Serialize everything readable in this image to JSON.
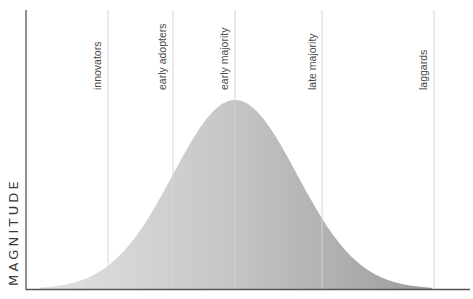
{
  "chart_data": {
    "type": "area",
    "title": "",
    "xlabel": "",
    "ylabel": "MAGNITUDE",
    "grid": false,
    "legend": null,
    "segments": [
      {
        "label": "innovators",
        "divider_x_px": 108
      },
      {
        "label": "early adopters",
        "divider_x_px": 173
      },
      {
        "label": "early majority",
        "divider_x_px": 235
      },
      {
        "label": "late majority",
        "divider_x_px": 322
      },
      {
        "label": "laggards",
        "divider_x_px": 434
      }
    ],
    "curve": {
      "shape": "normal distribution",
      "peak_x_px": 235,
      "peak_y_px": 100,
      "baseline_y_px": 289,
      "start_x_px": 40,
      "end_x_px": 432,
      "fill_gradient": [
        "#dcdcdc",
        "#c9c9c9",
        "#a4a4a4"
      ]
    },
    "axes": {
      "y_axis": {
        "x_px": 26,
        "top_px": 10,
        "bottom_px": 289
      },
      "x_axis": {
        "y_px": 289,
        "left_px": 26,
        "right_px": 470
      }
    }
  },
  "labels": {
    "y_axis": "MAGNITUDE",
    "seg0": "innovators",
    "seg1": "early adopters",
    "seg2": "early majority",
    "seg3": "late majority",
    "seg4": "laggards"
  }
}
